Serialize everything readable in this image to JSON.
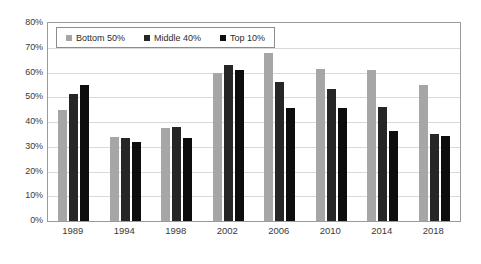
{
  "chart_data": {
    "type": "bar",
    "title": "",
    "subtitle": "",
    "xlabel": "",
    "ylabel": "",
    "categories": [
      "1989",
      "1994",
      "1998",
      "2002",
      "2006",
      "2010",
      "2014",
      "2018"
    ],
    "series": [
      {
        "name": "Bottom 50%",
        "color": "#a6a6a6",
        "values": [
          45.0,
          34.0,
          37.5,
          60.0,
          68.0,
          61.5,
          61.0,
          55.0
        ]
      },
      {
        "name": "Middle 40%",
        "color": "#262626",
        "values": [
          51.5,
          33.5,
          38.0,
          63.0,
          56.0,
          53.5,
          46.0,
          35.0
        ]
      },
      {
        "name": "Top 10%",
        "color": "#0d0d0d",
        "values": [
          55.0,
          32.0,
          33.5,
          61.0,
          45.5,
          45.5,
          36.5,
          34.5
        ]
      }
    ],
    "ylim": [
      0,
      80
    ],
    "ytick_step": 10,
    "ytick_labels": [
      "0%",
      "10%",
      "20%",
      "30%",
      "40%",
      "50%",
      "60%",
      "70%",
      "80%"
    ],
    "grid": true,
    "grid_axis": "y",
    "legend_position": "top-left-inside",
    "plot_border": true,
    "background_color": "#ffffff"
  }
}
